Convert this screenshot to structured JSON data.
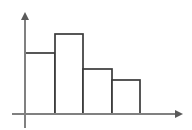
{
  "figure": {
    "title": "",
    "width": 192,
    "height": 130,
    "background": "#ffffff"
  },
  "axes": {
    "x_axis_name": "x-axis",
    "y_axis_name": "y-axis",
    "x_axis_label": "",
    "y_axis_label": "",
    "axis_color": "#808080",
    "arrow_color": "#5a5a5a",
    "x_axis_y_px": 114,
    "y_axis_x_px": 25,
    "x_axis_start_px": 12,
    "x_axis_end_px": 183,
    "y_axis_top_px": 12,
    "y_axis_bottom_px": 128,
    "has_x_arrow": true,
    "has_y_arrow": true,
    "grid": false,
    "tick_labels_x": [],
    "tick_labels_y": []
  },
  "style": {
    "bar_fill": "#ffffff",
    "bar_stroke": "#3a3a3a",
    "bar_stroke_width": 1.7
  },
  "chart_data": {
    "type": "bar",
    "title": "",
    "subtitle": "",
    "xlabel": "",
    "ylabel": "",
    "categories": [
      "bin-1",
      "bin-2",
      "bin-3",
      "bin-4"
    ],
    "values": [
      61,
      80,
      45,
      34
    ],
    "bin_edges": [
      25,
      55,
      83,
      112,
      140
    ],
    "bar_tops_px": [
      53,
      34,
      69,
      80
    ],
    "baseline_px": 114,
    "xlim": [
      25,
      140
    ],
    "ylim": [
      0,
      102
    ],
    "legend": [],
    "legend_position": "none",
    "annotations": [],
    "grid": false,
    "note": "Four-bar histogram with adjoining bars, white fill and dark outlines; heights in pixels above the x-axis baseline."
  }
}
